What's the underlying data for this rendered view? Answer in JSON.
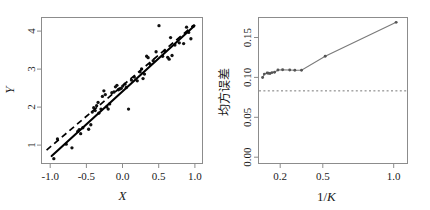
{
  "figure": {
    "width": 430,
    "height": 210,
    "background": "#ffffff",
    "panel_count": 2
  },
  "chart_data": [
    {
      "type": "scatter",
      "panel": "left",
      "title": "",
      "xlabel": "X",
      "ylabel": "Y",
      "xlim": [
        -1.12,
        1.1
      ],
      "ylim": [
        0.2,
        4.12
      ],
      "xticks": [
        -1.0,
        -0.5,
        0.0,
        0.5,
        1.0
      ],
      "xticklabels": [
        "-1.0",
        "-0.5",
        "0.0",
        "0.5",
        "1.0"
      ],
      "yticks": [
        1,
        2,
        3,
        4
      ],
      "yticklabels": [
        "1",
        "2",
        "3",
        "4"
      ],
      "grid": false,
      "legend": "none",
      "series": [
        {
          "name": "observations",
          "type": "scatter",
          "marker": "filled-circle",
          "color": "#111111",
          "points": [
            [
              -0.95,
              0.33
            ],
            [
              -0.9,
              0.86
            ],
            [
              -0.78,
              0.72
            ],
            [
              -0.7,
              0.62
            ],
            [
              -0.62,
              1.06
            ],
            [
              -0.6,
              1.11
            ],
            [
              -0.58,
              1.0
            ],
            [
              -0.55,
              1.16
            ],
            [
              -0.47,
              1.12
            ],
            [
              -0.44,
              1.24
            ],
            [
              -0.42,
              1.58
            ],
            [
              -0.4,
              1.7
            ],
            [
              -0.38,
              1.62
            ],
            [
              -0.36,
              1.75
            ],
            [
              -0.34,
              1.84
            ],
            [
              -0.33,
              1.55
            ],
            [
              -0.3,
              1.66
            ],
            [
              -0.28,
              2.0
            ],
            [
              -0.26,
              2.15
            ],
            [
              -0.24,
              2.05
            ],
            [
              -0.22,
              1.72
            ],
            [
              -0.2,
              1.66
            ],
            [
              -0.18,
              1.8
            ],
            [
              -0.15,
              2.1
            ],
            [
              -0.12,
              2.12
            ],
            [
              -0.1,
              2.26
            ],
            [
              -0.08,
              2.3
            ],
            [
              -0.06,
              2.18
            ],
            [
              -0.04,
              2.2
            ],
            [
              -0.02,
              2.22
            ],
            [
              0.0,
              2.28
            ],
            [
              0.03,
              2.33
            ],
            [
              0.05,
              2.24
            ],
            [
              0.08,
              1.66
            ],
            [
              0.12,
              2.44
            ],
            [
              0.16,
              2.52
            ],
            [
              0.2,
              2.42
            ],
            [
              0.24,
              2.66
            ],
            [
              0.26,
              2.74
            ],
            [
              0.28,
              2.48
            ],
            [
              0.3,
              2.6
            ],
            [
              0.33,
              3.08
            ],
            [
              0.35,
              3.04
            ],
            [
              0.38,
              2.86
            ],
            [
              0.42,
              2.96
            ],
            [
              0.46,
              3.2
            ],
            [
              0.5,
              3.9
            ],
            [
              0.55,
              3.08
            ],
            [
              0.58,
              3.22
            ],
            [
              0.62,
              3.05
            ],
            [
              0.64,
              3.0
            ],
            [
              0.66,
              3.58
            ],
            [
              0.68,
              3.1
            ],
            [
              0.72,
              3.38
            ],
            [
              0.78,
              3.44
            ],
            [
              0.84,
              3.42
            ],
            [
              0.88,
              3.86
            ],
            [
              0.91,
              3.72
            ],
            [
              0.94,
              3.55
            ],
            [
              0.97,
              3.88
            ]
          ]
        },
        {
          "name": "least-squares-fit",
          "type": "line",
          "style": "solid",
          "color": "#000000",
          "x": [
            -0.98,
            0.99
          ],
          "y": [
            0.4,
            3.9
          ]
        },
        {
          "name": "true-relationship",
          "type": "line",
          "style": "dashed",
          "color": "#000000",
          "x": [
            -1.05,
            0.99
          ],
          "y": [
            0.56,
            3.93
          ]
        }
      ]
    },
    {
      "type": "line",
      "panel": "right",
      "title": "",
      "xlabel": "1/K",
      "ylabel": "均方误差",
      "xlim": [
        0.03,
        1.08
      ],
      "ylim": [
        -0.004,
        0.192
      ],
      "xticks": [
        0.2,
        0.5,
        1.0
      ],
      "xticklabels": [
        "0.2",
        "0.5",
        "1.0"
      ],
      "yticks": [
        0.0,
        0.05,
        0.1,
        0.15
      ],
      "yticklabels": [
        "0.00",
        "0.05",
        "0.10",
        "0.15"
      ],
      "grid": false,
      "legend": "none",
      "series": [
        {
          "name": "test-mse-vs-1overK",
          "type": "line-marker",
          "style": "solid",
          "color": "#7a7a7a",
          "marker": "filled-circle",
          "x": [
            0.059,
            0.071,
            0.091,
            0.1,
            0.111,
            0.125,
            0.143,
            0.167,
            0.2,
            0.25,
            0.286,
            0.333,
            0.5,
            1.0
          ],
          "y": [
            0.1115,
            0.116,
            0.1175,
            0.1172,
            0.1168,
            0.118,
            0.1185,
            0.1215,
            0.1218,
            0.1215,
            0.1212,
            0.1212,
            0.14,
            0.1855
          ]
        },
        {
          "name": "irreducible-error",
          "type": "hline",
          "style": "dashed",
          "color": "#777777",
          "y": 0.0935
        }
      ]
    }
  ],
  "panel_left": {
    "name": "scatter-panel",
    "xlabel": "X",
    "ylabel": "Y",
    "xticklabels": [
      "-1.0",
      "-0.5",
      "0.0",
      "0.5",
      "1.0"
    ],
    "yticklabels": [
      "1",
      "2",
      "3",
      "4"
    ]
  },
  "panel_right": {
    "name": "mse-panel",
    "xlabel_prefix": "1/",
    "xlabel_var": "K",
    "ylabel": "均方误差",
    "xticklabels": [
      "0.2",
      "0.5",
      "1.0"
    ],
    "yticklabels": [
      "0.00",
      "0.05",
      "0.10",
      "0.15"
    ]
  }
}
